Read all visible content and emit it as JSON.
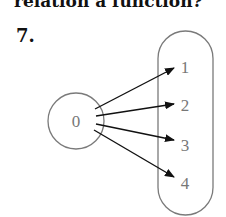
{
  "header": {
    "partial_text": "relation a function?"
  },
  "problem": {
    "number": "7."
  },
  "diagram": {
    "type": "mapping-diagram",
    "domain": {
      "values": [
        "0"
      ]
    },
    "range": {
      "values": [
        "1",
        "2",
        "3",
        "4"
      ]
    },
    "mappings": [
      {
        "from": "0",
        "to": "1"
      },
      {
        "from": "0",
        "to": "2"
      },
      {
        "from": "0",
        "to": "3"
      },
      {
        "from": "0",
        "to": "4"
      }
    ],
    "colors": {
      "shape_stroke": "#7a7a7a",
      "arrow": "#111111",
      "label": "#777777"
    }
  }
}
